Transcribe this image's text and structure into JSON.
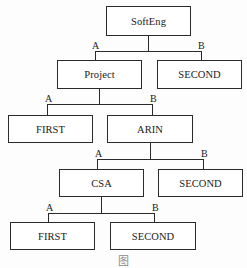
{
  "diagram": {
    "type": "decision-tree",
    "nodes": {
      "root": {
        "label": "SoftEng"
      },
      "project": {
        "label": "Project"
      },
      "second_1": {
        "label": "SECOND"
      },
      "first_1": {
        "label": "FIRST"
      },
      "arin": {
        "label": "ARIN"
      },
      "csa": {
        "label": "CSA"
      },
      "second_2": {
        "label": "SECOND"
      },
      "first_2": {
        "label": "FIRST"
      },
      "second_3": {
        "label": "SECOND"
      }
    },
    "edges": [
      {
        "from": "SoftEng",
        "to": "Project",
        "label": "A"
      },
      {
        "from": "SoftEng",
        "to": "SECOND",
        "label": "B"
      },
      {
        "from": "Project",
        "to": "FIRST",
        "label": "A"
      },
      {
        "from": "Project",
        "to": "ARIN",
        "label": "B"
      },
      {
        "from": "ARIN",
        "to": "CSA",
        "label": "A"
      },
      {
        "from": "ARIN",
        "to": "SECOND",
        "label": "B"
      },
      {
        "from": "CSA",
        "to": "FIRST",
        "label": "A"
      },
      {
        "from": "CSA",
        "to": "SECOND",
        "label": "B"
      }
    ],
    "edge_labels": {
      "a": "A",
      "b": "B"
    },
    "caption": "图"
  }
}
